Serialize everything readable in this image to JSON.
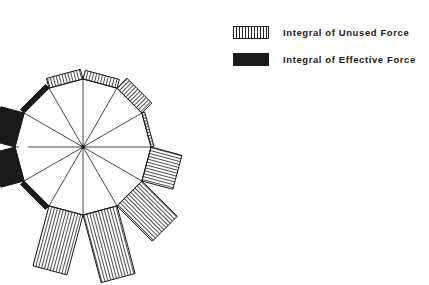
{
  "legend": {
    "items": [
      {
        "label": "Integral of Unused Force",
        "pattern": "vertical-hatch"
      },
      {
        "label": "Integral of Effective Force",
        "pattern": "solid-black"
      }
    ]
  },
  "colors": {
    "ink": "#1a1a1a",
    "background": "#ffffff"
  },
  "chart_data": {
    "type": "radial-bar",
    "title": "",
    "center": [
      83,
      147
    ],
    "radius": 68,
    "categories": [
      "edge-1 (75°)",
      "edge-2 (45°)",
      "edge-3 (15°)",
      "edge-4 (-15°)",
      "edge-5 (-45°)",
      "edge-6 (-75°)",
      "edge-7 (-105°)",
      "edge-8 (-135°)",
      "edge-9 (-165°)",
      "edge-10 (165°)",
      "edge-11 (135°)",
      "edge-12 (105°)"
    ],
    "series": [
      {
        "name": "Integral of Unused Force",
        "values": [
          9,
          14,
          3,
          32,
          50,
          70,
          62,
          0,
          0,
          0,
          0,
          10
        ]
      },
      {
        "name": "Integral of Effective Force",
        "values": [
          0,
          0,
          0,
          0,
          0,
          0,
          0,
          5,
          24,
          24,
          5,
          0
        ]
      }
    ],
    "mid_angles_deg": [
      75,
      45,
      15,
      -15,
      -45,
      -75,
      -105,
      -135,
      -165,
      165,
      135,
      105
    ],
    "legend_position": "top-right"
  }
}
